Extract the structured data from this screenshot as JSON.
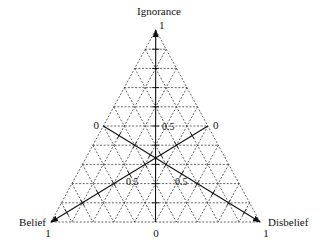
{
  "diagram": {
    "type": "opinion-triangle",
    "divisions": 10,
    "vertices": {
      "top": {
        "label": "Ignorance",
        "value_label": "1"
      },
      "bottom_left": {
        "label": "Belief",
        "value_label": "1"
      },
      "bottom_right": {
        "label": "Disbelief",
        "value_label": "1"
      }
    },
    "axis_labels": {
      "ignorance_origin": "0",
      "ignorance_mid": "0.5",
      "belief_origin": "0",
      "belief_mid": "0.5",
      "disbelief_origin": "0",
      "disbelief_mid": "0.5"
    },
    "colors": {
      "line": "#111111",
      "grid": "#222222",
      "background": "#ffffff"
    }
  }
}
